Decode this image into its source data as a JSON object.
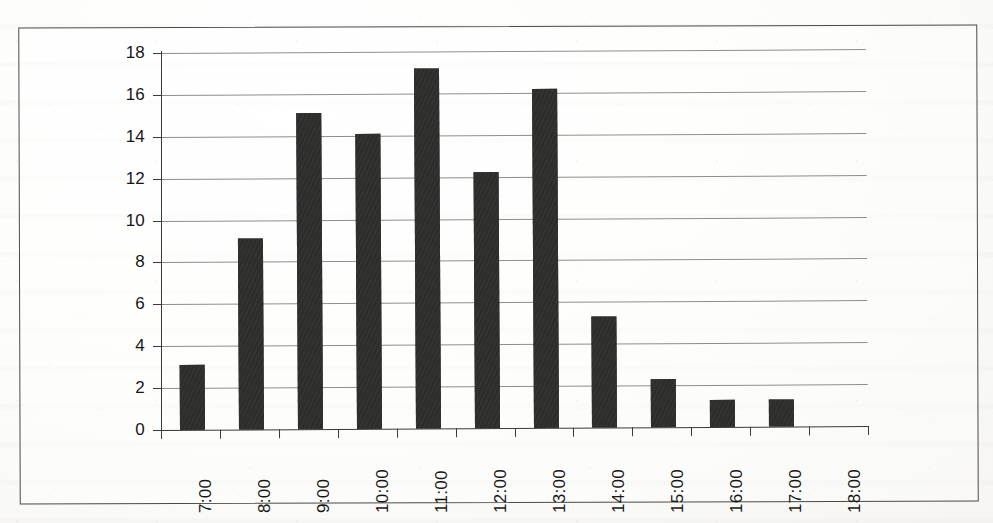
{
  "chart_data": {
    "type": "bar",
    "title": "",
    "subtitle": "",
    "xlabel": "",
    "ylabel": "",
    "categories": [
      "7:00",
      "8:00",
      "9:00",
      "10:00",
      "11:00",
      "12:00",
      "13:00",
      "14:00",
      "15:00",
      "16:00",
      "17:00",
      "18:00"
    ],
    "values": [
      3.1,
      9.1,
      15.1,
      14.1,
      17.2,
      12.2,
      16.2,
      5.3,
      2.3,
      1.3,
      1.3,
      0
    ],
    "series": [
      {
        "name": "",
        "values": [
          3.1,
          9.1,
          15.1,
          14.1,
          17.2,
          12.2,
          16.2,
          5.3,
          2.3,
          1.3,
          1.3,
          0
        ]
      }
    ],
    "ylim": [
      0,
      18
    ],
    "ytick_labels": [
      "0",
      "2",
      "4",
      "6",
      "8",
      "10",
      "12",
      "14",
      "16",
      "18"
    ],
    "ytick_values": [
      0,
      2,
      4,
      6,
      8,
      10,
      12,
      14,
      16,
      18
    ],
    "grid": "horizontal",
    "legend": "none",
    "bar_color": "#2d2d2b",
    "gridline_color": "#8e8e8c",
    "axis_color": "#3a3a38",
    "background_color": "#fbfaf7"
  }
}
